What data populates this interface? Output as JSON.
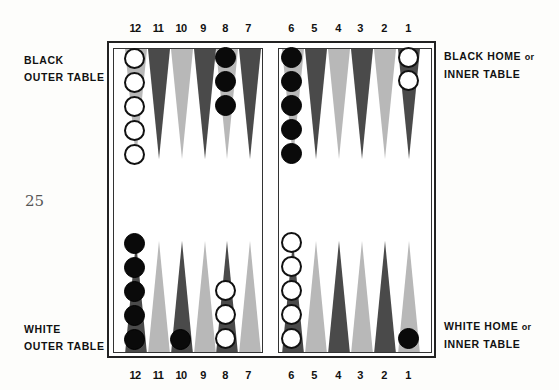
{
  "page": {
    "page_number": "25"
  },
  "top_point_numbers": [
    "12",
    "11",
    "10",
    "9",
    "8",
    "7",
    "6",
    "5",
    "4",
    "3",
    "2",
    "1"
  ],
  "bottom_point_numbers": [
    "12",
    "11",
    "10",
    "9",
    "8",
    "7",
    "6",
    "5",
    "4",
    "3",
    "2",
    "1"
  ],
  "labels": {
    "black_outer": {
      "line1": "BLACK",
      "line2": "OUTER TABLE"
    },
    "black_home": {
      "line1": "BLACK HOME",
      "or": "or",
      "line2": "INNER TABLE"
    },
    "white_outer": {
      "line1": "WHITE",
      "line2": "OUTER TABLE"
    },
    "white_home": {
      "line1": "WHITE HOME",
      "or": "or",
      "line2": "INNER TABLE"
    }
  },
  "colors": {
    "dark_point": "#4a4a4a",
    "light_point": "#b8b8b8",
    "black_checker": "#0a0a0a",
    "white_checker": "#ffffff",
    "frame": "#222222"
  },
  "board": {
    "top_row": [
      {
        "point": "12",
        "shade": "light",
        "checkers": {
          "color": "white",
          "count": 5
        }
      },
      {
        "point": "11",
        "shade": "dark",
        "checkers": null
      },
      {
        "point": "10",
        "shade": "light",
        "checkers": null
      },
      {
        "point": "9",
        "shade": "dark",
        "checkers": null
      },
      {
        "point": "8",
        "shade": "light",
        "checkers": {
          "color": "black",
          "count": 3
        }
      },
      {
        "point": "7",
        "shade": "dark",
        "checkers": null
      },
      {
        "point": "6",
        "shade": "light",
        "checkers": {
          "color": "black",
          "count": 5
        }
      },
      {
        "point": "5",
        "shade": "dark",
        "checkers": null
      },
      {
        "point": "4",
        "shade": "light",
        "checkers": null
      },
      {
        "point": "3",
        "shade": "dark",
        "checkers": null
      },
      {
        "point": "2",
        "shade": "light",
        "checkers": null
      },
      {
        "point": "1",
        "shade": "dark",
        "checkers": {
          "color": "white",
          "count": 2
        }
      }
    ],
    "bottom_row": [
      {
        "point": "12",
        "shade": "dark",
        "checkers": {
          "color": "black",
          "count": 5
        }
      },
      {
        "point": "11",
        "shade": "light",
        "checkers": null
      },
      {
        "point": "10",
        "shade": "dark",
        "checkers": {
          "color": "black",
          "count": 1
        }
      },
      {
        "point": "9",
        "shade": "light",
        "checkers": null
      },
      {
        "point": "8",
        "shade": "dark",
        "checkers": {
          "color": "white",
          "count": 3
        }
      },
      {
        "point": "7",
        "shade": "light",
        "checkers": null
      },
      {
        "point": "6",
        "shade": "dark",
        "checkers": {
          "color": "white",
          "count": 5
        }
      },
      {
        "point": "5",
        "shade": "light",
        "checkers": null
      },
      {
        "point": "4",
        "shade": "dark",
        "checkers": null
      },
      {
        "point": "3",
        "shade": "light",
        "checkers": null
      },
      {
        "point": "2",
        "shade": "dark",
        "checkers": null
      },
      {
        "point": "1",
        "shade": "light",
        "checkers": {
          "color": "black",
          "count": 1
        }
      }
    ]
  }
}
